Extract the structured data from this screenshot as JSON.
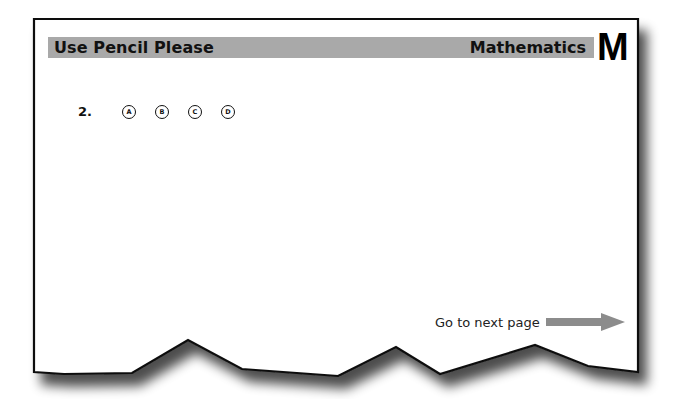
{
  "header": {
    "left_title": "Use Pencil Please",
    "right_title": "Mathematics",
    "subject_letter": "M",
    "bar_color": "#a9a9a9"
  },
  "question": {
    "number": "2.",
    "options": [
      "A",
      "B",
      "C",
      "D"
    ]
  },
  "footer": {
    "next_label": "Go to next page",
    "arrow_icon": "right-arrow-icon",
    "arrow_color": "#8c8c8c"
  }
}
